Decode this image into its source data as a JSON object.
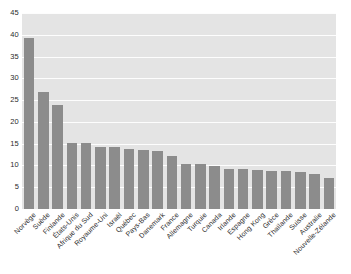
{
  "chart_data": {
    "type": "bar",
    "title": "",
    "subtitle": "",
    "xlabel": "",
    "ylabel": "",
    "ylim": [
      0,
      45
    ],
    "ytick_step": 5,
    "yticks": [
      "45",
      "40",
      "35",
      "30",
      "25",
      "20",
      "15",
      "10",
      "5",
      "0"
    ],
    "grid": true,
    "legend": false,
    "legend_position": "none",
    "bar_color": "#8c8c8c",
    "plot_background": "#e4e4e4",
    "gridline_color": "#fdfdfd",
    "categories": [
      "Norvège",
      "Suède",
      "Finlande",
      "États-Unis",
      "Afrique du Sud",
      "Royaume-Uni",
      "Israël",
      "Québec",
      "Pays-Bas",
      "Danemark",
      "France",
      "Allemagne",
      "Turquie",
      "Canada",
      "Irlande",
      "Espagne",
      "Hong Kong",
      "Grèce",
      "Thaïlande",
      "Suisse",
      "Australie",
      "Nouvelle-Zélande"
    ],
    "values": [
      39.3,
      26.8,
      23.9,
      15.2,
      15.1,
      14.3,
      14.3,
      13.8,
      13.5,
      13.4,
      12.2,
      10.4,
      10.3,
      9.9,
      9.2,
      9.1,
      9.0,
      8.7,
      8.7,
      8.6,
      8.1,
      7.2
    ]
  }
}
